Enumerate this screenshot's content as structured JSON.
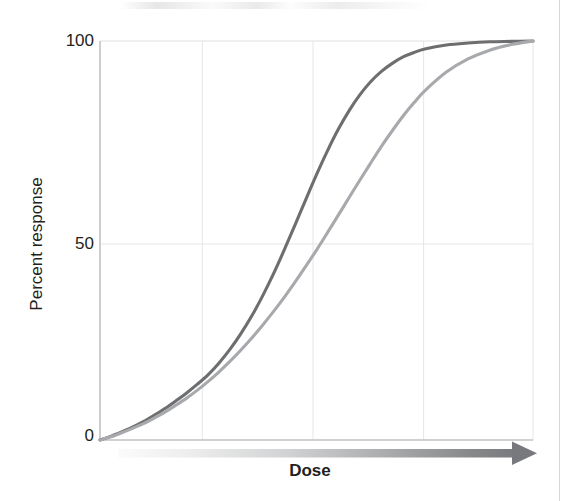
{
  "figure": {
    "background_color": "#ffffff",
    "page_edge_color": "#d8d8d8"
  },
  "axes": {
    "y_label": "Percent response",
    "x_label": "Dose",
    "y_ticks": [
      "0",
      "50",
      "100"
    ],
    "x_ticks": []
  },
  "colors": {
    "curve_dark": "#6d6e70",
    "curve_light": "#a7a9ac",
    "grid": "#e3e3e3",
    "axis": "#bcbcbc",
    "text": "#231f20",
    "arrow_start": "#f2f2f2",
    "arrow_end": "#77797c"
  },
  "chart_data": {
    "type": "line",
    "title": "",
    "subtitle": "",
    "xlabel": "Dose",
    "ylabel": "Percent response",
    "xlim": [
      0,
      4
    ],
    "ylim": [
      0,
      100
    ],
    "grid": true,
    "legend": "none",
    "x_axis_style": "gradient-arrow",
    "x_tick_labels": [],
    "y_tick_labels": [
      "0",
      "50",
      "100"
    ],
    "y_tick_values": [
      0,
      50,
      100
    ],
    "x_gridline_values": [
      1,
      2,
      3
    ],
    "y_gridline_values": [
      50
    ],
    "annotations": [],
    "series": [
      {
        "name": "High-potency agonist",
        "color": "#6d6e70",
        "x": [
          0.0,
          0.1,
          0.2,
          0.3,
          0.4,
          0.5,
          0.6,
          0.7,
          0.8,
          0.9,
          1.0,
          1.1,
          1.2,
          1.3,
          1.4,
          1.5,
          1.6,
          1.7,
          1.8,
          1.9,
          2.0,
          2.1,
          2.2,
          2.3,
          2.4,
          2.5,
          2.6,
          2.7,
          2.8,
          2.9,
          3.0,
          3.2,
          3.4,
          3.6,
          3.8,
          4.0
        ],
        "y": [
          0.0,
          0.9,
          2.0,
          3.2,
          4.6,
          6.2,
          7.9,
          9.8,
          11.8,
          14.0,
          16.4,
          19.3,
          22.7,
          26.6,
          31.0,
          36.0,
          41.5,
          47.5,
          53.8,
          60.2,
          66.5,
          72.4,
          77.8,
          82.5,
          86.5,
          89.8,
          92.4,
          94.4,
          96.0,
          97.1,
          98.0,
          99.0,
          99.5,
          99.8,
          99.9,
          100.0
        ]
      },
      {
        "name": "Low-potency agonist",
        "color": "#a7a9ac",
        "x": [
          0.0,
          0.1,
          0.2,
          0.3,
          0.4,
          0.5,
          0.6,
          0.7,
          0.8,
          0.9,
          1.0,
          1.1,
          1.2,
          1.3,
          1.4,
          1.5,
          1.6,
          1.7,
          1.8,
          1.9,
          2.0,
          2.1,
          2.2,
          2.3,
          2.4,
          2.5,
          2.6,
          2.7,
          2.8,
          2.9,
          3.0,
          3.2,
          3.4,
          3.6,
          3.8,
          4.0
        ],
        "y": [
          0.0,
          0.8,
          1.8,
          2.9,
          4.1,
          5.5,
          7.0,
          8.7,
          10.5,
          12.5,
          14.7,
          17.1,
          19.7,
          22.5,
          25.5,
          28.7,
          32.1,
          35.7,
          39.5,
          43.5,
          47.6,
          51.9,
          56.3,
          60.7,
          65.1,
          69.4,
          73.6,
          77.5,
          81.2,
          84.5,
          87.5,
          92.2,
          95.5,
          97.7,
          99.1,
          100.0
        ]
      }
    ]
  }
}
